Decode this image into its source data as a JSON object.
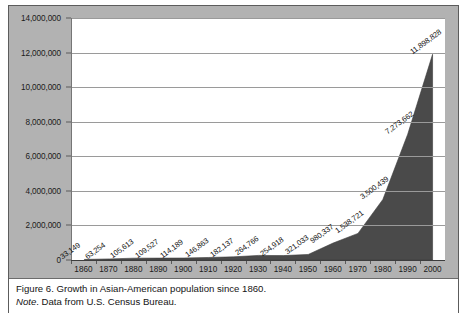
{
  "figure": {
    "caption_line1": "Figure 6. Growth in Asian-American population since 1860.",
    "note_label": "Note",
    "note_rest": ". Data from U.S. Census Bureau."
  },
  "colors": {
    "area_fill": "#4a4a4a",
    "plate_background": "#b2b2b2",
    "plot_background": "#ffffff",
    "gridline": "#9a9a9a",
    "axis": "#3d3d3d",
    "text": "#1a1a1a"
  },
  "chart_data": {
    "type": "area",
    "title": "Growth in Asian-American population since 1860",
    "xlabel": "",
    "ylabel": "",
    "grid": true,
    "legend": "none",
    "ylim": [
      0,
      14000000
    ],
    "ytick_step": 2000000,
    "ytick_labels": [
      "14,000,000",
      "12,000,000",
      "10,000,000",
      "8,000,000",
      "6,000,000",
      "4,000,000",
      "2,000,000",
      "0"
    ],
    "ytick_values": [
      14000000,
      12000000,
      10000000,
      8000000,
      6000000,
      4000000,
      2000000,
      0
    ],
    "categories": [
      "1860",
      "1870",
      "1880",
      "1890",
      "1900",
      "1910",
      "1920",
      "1930",
      "1940",
      "1950",
      "1960",
      "1970",
      "1980",
      "1990",
      "2000"
    ],
    "values": [
      33149,
      63254,
      105613,
      109527,
      114189,
      146863,
      182137,
      264766,
      254918,
      321033,
      980337,
      1538721,
      3500439,
      7273662,
      11898828
    ],
    "data_labels": [
      "33,149",
      "63,254",
      "105,613",
      "109,527",
      "114,189",
      "146,863",
      "182,137",
      "264,766",
      "254,918",
      "321,033",
      "980,337",
      "1,538,721",
      "3,500,439",
      "7,273,662",
      "11,898,828"
    ]
  }
}
